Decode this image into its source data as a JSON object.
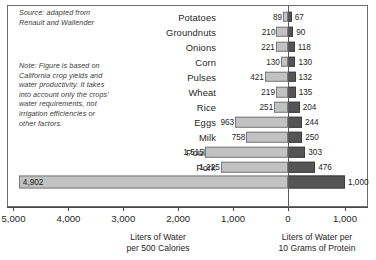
{
  "annotations": {
    "source": "Source: adapted from\nRenault and Wallender",
    "note": "Note: Figure is based on\nCalifornia crop yields and\nwater productivity. It takes\ninto account only the crops'\nwater requirements, not\nirrigation efficiencies or\nother factors."
  },
  "axis": {
    "left_title": "Liters of Water\nper 500 Calories",
    "right_title": "Liters of Water per\n10 Grams of Protein",
    "tick_labels": [
      "5,000",
      "4,000",
      "3,000",
      "2,000",
      "1,000",
      "0",
      "1,000"
    ]
  },
  "colors": {
    "left_bar": "#c2c2c2",
    "right_bar": "#555555",
    "frame": "#6d6d6d",
    "text": "#262626"
  },
  "chart_data": {
    "type": "bar",
    "title": "",
    "orientation": "horizontal-diverging",
    "categories": [
      "Potatoes",
      "Groundnuts",
      "Onions",
      "Corn",
      "Pulses",
      "Wheat",
      "Rice",
      "Eggs",
      "Milk",
      "Poultry",
      "Pork",
      "Beef"
    ],
    "series": [
      {
        "name": "Liters of Water per 500 Calories",
        "side": "left",
        "color": "#c2c2c2",
        "values": [
          89,
          210,
          221,
          130,
          421,
          219,
          251,
          963,
          758,
          1515,
          1225,
          4902
        ],
        "labels": [
          "89",
          "210",
          "221",
          "130",
          "421",
          "219",
          "251",
          "963",
          "758",
          "1,515",
          "1,225",
          "4,902"
        ]
      },
      {
        "name": "Liters of Water per 10 Grams of Protein",
        "side": "right",
        "color": "#555555",
        "values": [
          67,
          90,
          118,
          130,
          132,
          135,
          204,
          244,
          250,
          303,
          476,
          1000
        ],
        "labels": [
          "67",
          "90",
          "118",
          "130",
          "132",
          "135",
          "204",
          "244",
          "250",
          "303",
          "476",
          "1,000"
        ]
      }
    ],
    "xlabel_left": "Liters of Water per 500 Calories",
    "xlabel_right": "Liters of Water per 10 Grams of Protein",
    "ylabel": "",
    "xlim_left": [
      0,
      5000
    ],
    "xlim_right": [
      0,
      1200
    ],
    "ticks_left": [
      5000,
      4000,
      3000,
      2000,
      1000,
      0
    ],
    "ticks_right": [
      1000
    ],
    "grid": false,
    "legend": "none",
    "highlight_row": "Beef"
  }
}
